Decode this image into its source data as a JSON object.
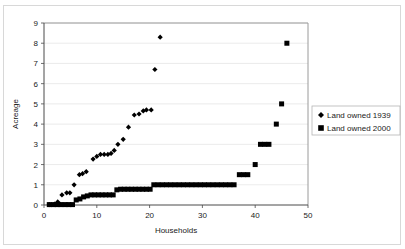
{
  "chart_data": {
    "type": "scatter",
    "title": "",
    "xlabel": "Households",
    "ylabel": "Acreage",
    "xlim": [
      0,
      50
    ],
    "ylim": [
      0,
      9
    ],
    "xticks": [
      0,
      10,
      20,
      30,
      40,
      50
    ],
    "yticks": [
      0,
      1,
      2,
      3,
      4,
      5,
      6,
      7,
      8,
      9
    ],
    "grid": "horizontal",
    "legend_position": "right",
    "series": [
      {
        "name": "Land owned 1939",
        "marker": "diamond",
        "color": "#000000",
        "points": [
          [
            1,
            0.02
          ],
          [
            2,
            0.05
          ],
          [
            2.6,
            0.15
          ],
          [
            3,
            0.05
          ],
          [
            3.4,
            0.5
          ],
          [
            4.3,
            0.6
          ],
          [
            4.9,
            0.6
          ],
          [
            5.7,
            1.0
          ],
          [
            6.7,
            1.5
          ],
          [
            7.3,
            1.55
          ],
          [
            8.0,
            1.65
          ],
          [
            9.3,
            2.27
          ],
          [
            10.0,
            2.4
          ],
          [
            10.7,
            2.5
          ],
          [
            11.4,
            2.5
          ],
          [
            12.1,
            2.5
          ],
          [
            12.7,
            2.55
          ],
          [
            13.3,
            2.7
          ],
          [
            14.0,
            3.0
          ],
          [
            15.0,
            3.25
          ],
          [
            16.0,
            3.85
          ],
          [
            17.1,
            4.45
          ],
          [
            18.0,
            4.5
          ],
          [
            18.8,
            4.65
          ],
          [
            19.4,
            4.7
          ],
          [
            20.3,
            4.7
          ],
          [
            21.0,
            6.7
          ],
          [
            22.0,
            8.3
          ]
        ]
      },
      {
        "name": "Land owned 2000",
        "marker": "square",
        "color": "#000000",
        "points": [
          [
            1,
            0.02
          ],
          [
            1.8,
            0.02
          ],
          [
            2.5,
            0.02
          ],
          [
            3.2,
            0.02
          ],
          [
            4.0,
            0.02
          ],
          [
            4.7,
            0.02
          ],
          [
            5.4,
            0.02
          ],
          [
            6.1,
            0.25
          ],
          [
            6.8,
            0.3
          ],
          [
            7.5,
            0.4
          ],
          [
            8.2,
            0.45
          ],
          [
            8.9,
            0.5
          ],
          [
            9.6,
            0.5
          ],
          [
            10.3,
            0.5
          ],
          [
            11.0,
            0.5
          ],
          [
            11.7,
            0.5
          ],
          [
            12.4,
            0.5
          ],
          [
            13.1,
            0.5
          ],
          [
            13.8,
            0.75
          ],
          [
            14.5,
            0.78
          ],
          [
            15.2,
            0.78
          ],
          [
            15.9,
            0.78
          ],
          [
            16.6,
            0.78
          ],
          [
            17.3,
            0.78
          ],
          [
            18.0,
            0.78
          ],
          [
            18.7,
            0.78
          ],
          [
            19.4,
            0.78
          ],
          [
            20.1,
            0.78
          ],
          [
            20.8,
            1.0
          ],
          [
            21.6,
            1.0
          ],
          [
            22.4,
            1.0
          ],
          [
            23.2,
            1.0
          ],
          [
            24.0,
            1.0
          ],
          [
            24.8,
            1.0
          ],
          [
            25.6,
            1.0
          ],
          [
            26.4,
            1.0
          ],
          [
            27.2,
            1.0
          ],
          [
            28.0,
            1.0
          ],
          [
            28.8,
            1.0
          ],
          [
            29.6,
            1.0
          ],
          [
            30.4,
            1.0
          ],
          [
            31.2,
            1.0
          ],
          [
            32.0,
            1.0
          ],
          [
            32.8,
            1.0
          ],
          [
            33.6,
            1.0
          ],
          [
            34.4,
            1.0
          ],
          [
            35.2,
            1.0
          ],
          [
            36.0,
            1.0
          ],
          [
            37.0,
            1.5
          ],
          [
            37.8,
            1.5
          ],
          [
            38.6,
            1.5
          ],
          [
            40.0,
            2.0
          ],
          [
            41.0,
            3.0
          ],
          [
            41.8,
            3.0
          ],
          [
            42.6,
            3.0
          ],
          [
            44.0,
            4.0
          ],
          [
            45.0,
            5.0
          ],
          [
            46.0,
            8.0
          ]
        ]
      }
    ],
    "legend_entries": [
      {
        "label": "Land owned 1939",
        "marker": "diamond"
      },
      {
        "label": "Land owned 2000",
        "marker": "square"
      }
    ]
  }
}
